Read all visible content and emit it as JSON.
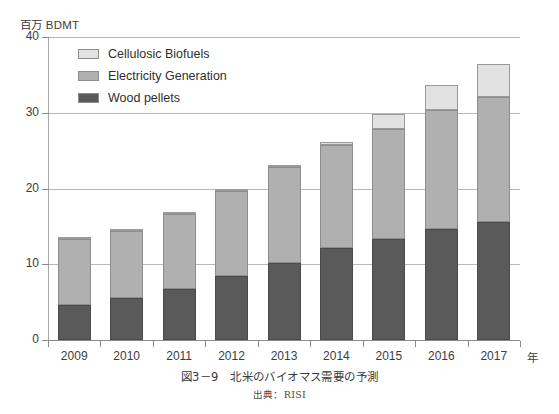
{
  "chart_data": {
    "type": "bar",
    "subtype": "stacked-column",
    "title": "北米のバイオマス需要の予測",
    "figure_number": "図3-9",
    "source": "出典：RISI",
    "ylabel": "百万 BDMT",
    "xlabel": "年",
    "ylim": [
      0,
      40
    ],
    "yticks": [
      0,
      10,
      20,
      30,
      40
    ],
    "ytick_labels": [
      "0",
      "10",
      "20",
      "30",
      "40"
    ],
    "grid": true,
    "legend_position": "top-left",
    "categories": [
      "2009",
      "2010",
      "2011",
      "2012",
      "2013",
      "2014",
      "2015",
      "2016",
      "2017"
    ],
    "series": [
      {
        "name": "Wood pellets",
        "color": "#5a5a5a",
        "values": [
          4.6,
          5.5,
          6.8,
          8.5,
          10.2,
          12.2,
          13.4,
          14.6,
          15.6
        ]
      },
      {
        "name": "Electricity Generation",
        "color": "#b0b0b0",
        "values": [
          8.8,
          8.9,
          9.9,
          11.2,
          12.6,
          13.6,
          14.4,
          15.7,
          16.5
        ]
      },
      {
        "name": "Cellulosic Biofuels",
        "color": "#e2e2e2",
        "values": [
          0.1,
          0.3,
          0.2,
          0.3,
          0.2,
          0.4,
          2.0,
          3.4,
          4.3
        ]
      }
    ],
    "totals": [
      13.5,
      14.7,
      16.9,
      20.0,
      23.0,
      26.2,
      29.8,
      33.7,
      36.4
    ],
    "stack_order_bottom_to_top": [
      "Wood pellets",
      "Electricity Generation",
      "Cellulosic Biofuels"
    ]
  },
  "legend": {
    "entries": [
      {
        "label": "Cellulosic Biofuels",
        "color": "#e2e2e2"
      },
      {
        "label": "Electricity Generation",
        "color": "#b0b0b0"
      },
      {
        "label": "Wood pellets",
        "color": "#5a5a5a"
      }
    ]
  },
  "axes": {
    "y_unit": "百万 BDMT",
    "x_unit": "年"
  },
  "caption": {
    "title": "図3－9　北米のバイオマス需要の予測",
    "source": "出典：RISI"
  }
}
